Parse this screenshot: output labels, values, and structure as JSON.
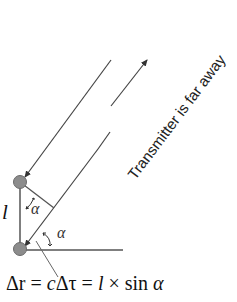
{
  "diagram": {
    "label_transmitter": "Transmitter is far away",
    "label_length": "l",
    "label_angle_top": "α",
    "label_angle_bottom": "α",
    "formula": {
      "delta_r": "Δr",
      "eq1": " = ",
      "c": "c",
      "delta_tau": "Δτ",
      "eq2": " = ",
      "l": "l",
      "times": " × sin ",
      "alpha": "α"
    },
    "colors": {
      "line": "#444444",
      "antenna_fill": "#8c8c8c",
      "antenna_stroke": "#6a6a6a",
      "text": "#222222"
    }
  }
}
